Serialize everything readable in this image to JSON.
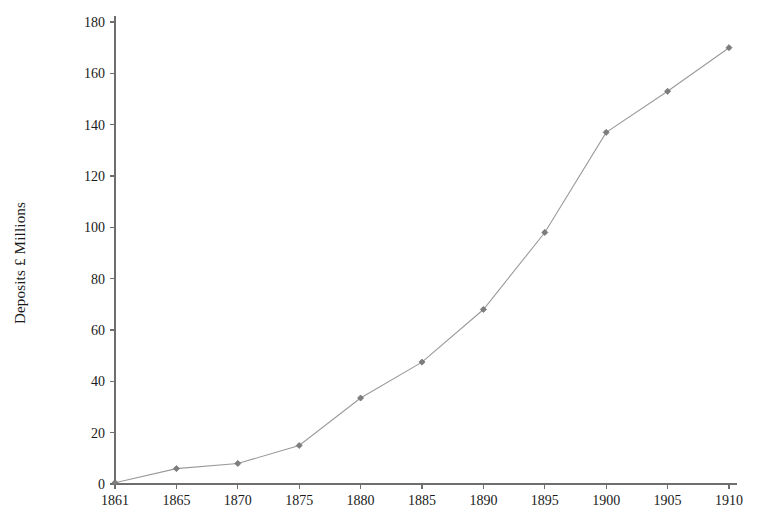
{
  "chart_data": {
    "type": "line",
    "title": "",
    "xlabel": "",
    "ylabel": "Deposits £ Millions",
    "x": [
      1861,
      1865,
      1870,
      1875,
      1880,
      1885,
      1890,
      1895,
      1900,
      1905,
      1910
    ],
    "values": [
      0.5,
      6,
      8,
      15,
      33.5,
      47.5,
      68,
      98,
      137,
      153,
      170
    ],
    "xtick_labels": [
      "1861",
      "1865",
      "1870",
      "1875",
      "1880",
      "1885",
      "1890",
      "1895",
      "1900",
      "1905",
      "1910"
    ],
    "ytick_labels": [
      "0",
      "20",
      "40",
      "60",
      "80",
      "100",
      "120",
      "140",
      "160",
      "180"
    ],
    "ytick_values": [
      0,
      20,
      40,
      60,
      80,
      100,
      120,
      140,
      160,
      180
    ],
    "ylim": [
      0,
      180
    ],
    "xlim": [
      1861,
      1910
    ],
    "grid": false,
    "legend": "none",
    "marker": "diamond",
    "line_color": "#9a9a9a",
    "marker_color": "#7d7d7d",
    "axis_color": "#6e6e6e",
    "text_color": "#1a1a1a",
    "background_color": "#ffffff"
  }
}
